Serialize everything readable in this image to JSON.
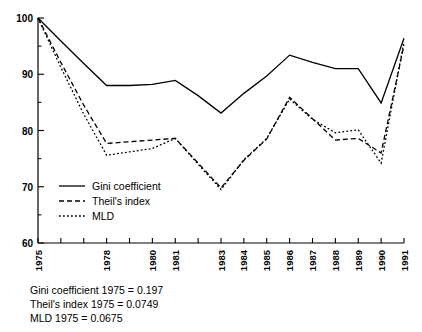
{
  "chart_data": {
    "type": "line",
    "title": "",
    "xlabel": "",
    "ylabel": "",
    "xlim": [
      1975,
      1991
    ],
    "ylim": [
      60,
      100
    ],
    "grid": false,
    "legend_position": "inside-lower-left",
    "x": [
      1975,
      1976,
      1977,
      1978,
      1979,
      1980,
      1981,
      1982,
      1983,
      1984,
      1985,
      1986,
      1987,
      1988,
      1989,
      1990,
      1991
    ],
    "x_tick_labels": [
      "1975",
      "",
      "",
      "1978",
      "",
      "1980",
      "1981",
      "",
      "1983",
      "1984",
      "1985",
      "1986",
      "1987",
      "1988",
      "1989",
      "1990",
      "1991"
    ],
    "y_ticks": [
      60,
      70,
      80,
      90,
      100
    ],
    "y_minor_ticks": [
      65,
      75,
      85,
      95
    ],
    "series": [
      {
        "name": "Gini coefficient",
        "style": "solid",
        "values": [
          100.0,
          95.9,
          91.9,
          88.0,
          88.0,
          88.2,
          88.9,
          86.2,
          83.1,
          86.6,
          89.7,
          93.4,
          92.1,
          91.0,
          91.0,
          84.9,
          96.4
        ]
      },
      {
        "name": "Theil's index",
        "style": "dashed",
        "values": [
          100.0,
          92.1,
          84.5,
          77.7,
          78.0,
          78.3,
          78.6,
          74.2,
          69.8,
          74.7,
          78.5,
          85.9,
          82.1,
          78.3,
          78.6,
          76.0,
          95.2
        ]
      },
      {
        "name": "MLD",
        "style": "dotted",
        "values": [
          100.0,
          91.2,
          82.9,
          75.6,
          76.2,
          76.8,
          78.6,
          74.0,
          69.5,
          74.8,
          78.6,
          85.6,
          82.0,
          79.6,
          80.1,
          74.2,
          95.8
        ]
      }
    ]
  },
  "legend": {
    "items": [
      {
        "label": "Gini coefficient",
        "style": "solid"
      },
      {
        "label": "Theil's index",
        "style": "dashed"
      },
      {
        "label": "MLD",
        "style": "dotted"
      }
    ]
  },
  "footnotes": [
    "Gini coefficient 1975 = 0.197",
    "Theil's index 1975 = 0.0749",
    "MLD 1975 = 0.0675"
  ]
}
